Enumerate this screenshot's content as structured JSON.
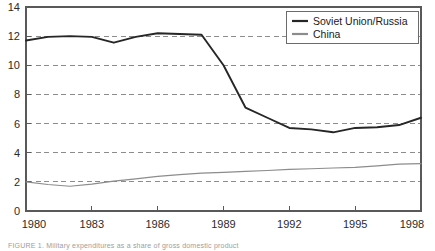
{
  "figure": {
    "caption": "FIGURE 1.  Military expenditures as a share of gross domestic product"
  },
  "legend": {
    "position": "top-right",
    "entries": [
      {
        "label": "Soviet Union/Russia",
        "color": "#262626"
      },
      {
        "label": "China",
        "color": "#8c8c8c"
      }
    ]
  },
  "axes": {
    "y_ticks": [
      "0",
      "2",
      "4",
      "6",
      "8",
      "10",
      "12",
      "14"
    ],
    "x_ticks": [
      "1980",
      "1983",
      "1986",
      "1989",
      "1992",
      "1995",
      "1998"
    ]
  },
  "chart_data": {
    "type": "line",
    "title": "",
    "xlabel": "",
    "ylabel": "",
    "xlim": [
      1980,
      1998
    ],
    "ylim": [
      0,
      14
    ],
    "grid": true,
    "grid_style": "dashed-horizontal",
    "legend_position": "top-right",
    "x": [
      1980,
      1981,
      1982,
      1983,
      1984,
      1985,
      1986,
      1987,
      1988,
      1989,
      1990,
      1991,
      1992,
      1993,
      1994,
      1995,
      1996,
      1997,
      1998
    ],
    "series": [
      {
        "name": "Soviet Union/Russia",
        "color": "#262626",
        "width": 1.9,
        "values": [
          11.7,
          11.95,
          12.0,
          11.95,
          11.55,
          11.95,
          12.2,
          12.15,
          12.1,
          10.0,
          7.1,
          6.4,
          5.7,
          5.6,
          5.4,
          5.7,
          5.75,
          5.9,
          6.4
        ]
      },
      {
        "name": "China",
        "color": "#8c8c8c",
        "width": 1.2,
        "values": [
          2.0,
          1.82,
          1.7,
          1.85,
          2.05,
          2.2,
          2.38,
          2.5,
          2.6,
          2.65,
          2.72,
          2.78,
          2.85,
          2.9,
          2.95,
          3.0,
          3.1,
          3.22,
          3.25
        ]
      }
    ]
  }
}
